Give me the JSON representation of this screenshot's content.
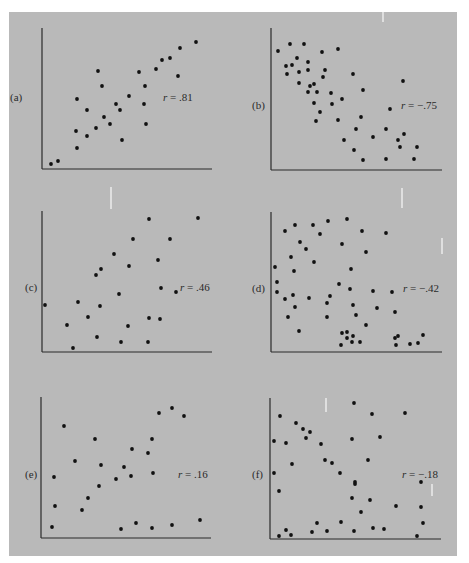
{
  "colors": {
    "background": "#b9b9b9",
    "axis": "#2a2a2a",
    "point": "#111111",
    "text": "#2a2a2a"
  },
  "chart_data": [
    {
      "type": "scatter",
      "panel": "(a)",
      "title": "",
      "r_label": "r = .81",
      "r": 0.81,
      "xlabel": "",
      "ylabel": "",
      "xlim": [
        0,
        100
      ],
      "ylim": [
        0,
        100
      ],
      "grid": false,
      "axes_px": {
        "x0": 42,
        "y0": 169,
        "x1": 212,
        "ytop": 28
      },
      "label_px": {
        "panel": [
          10,
          93
        ],
        "r": [
          163,
          93
        ]
      },
      "points_px": [
        [
          51,
          164
        ],
        [
          58,
          161
        ],
        [
          77,
          99
        ],
        [
          87,
          110
        ],
        [
          76,
          131
        ],
        [
          77,
          148
        ],
        [
          87,
          136
        ],
        [
          96,
          128
        ],
        [
          104,
          117
        ],
        [
          110,
          124
        ],
        [
          116,
          104
        ],
        [
          120,
          110
        ],
        [
          122,
          140
        ],
        [
          98,
          71
        ],
        [
          102,
          86
        ],
        [
          129,
          96
        ],
        [
          139,
          72
        ],
        [
          145,
          86
        ],
        [
          144,
          104
        ],
        [
          146,
          124
        ],
        [
          156,
          69
        ],
        [
          162,
          60
        ],
        [
          170,
          58
        ],
        [
          178,
          76
        ],
        [
          180,
          48
        ],
        [
          196,
          42
        ]
      ]
    },
    {
      "type": "scatter",
      "panel": "(b)",
      "title": "",
      "r_label": "r = −.75",
      "r": -0.75,
      "xlabel": "",
      "ylabel": "",
      "xlim": [
        0,
        100
      ],
      "ylim": [
        0,
        100
      ],
      "grid": false,
      "axes_px": {
        "x0": 271,
        "y0": 170,
        "x1": 442,
        "ytop": 28
      },
      "label_px": {
        "panel": [
          252,
          101
        ],
        "r": [
          401,
          101
        ]
      },
      "points_px": [
        [
          278,
          51
        ],
        [
          290,
          44
        ],
        [
          304,
          44
        ],
        [
          297,
          58
        ],
        [
          286,
          66
        ],
        [
          292,
          65
        ],
        [
          287,
          74
        ],
        [
          299,
          72
        ],
        [
          308,
          62
        ],
        [
          308,
          70
        ],
        [
          322,
          52
        ],
        [
          338,
          49
        ],
        [
          325,
          70
        ],
        [
          323,
          77
        ],
        [
          299,
          83
        ],
        [
          310,
          86
        ],
        [
          314,
          84
        ],
        [
          308,
          92
        ],
        [
          317,
          92
        ],
        [
          314,
          103
        ],
        [
          320,
          112
        ],
        [
          316,
          121
        ],
        [
          331,
          93
        ],
        [
          332,
          104
        ],
        [
          342,
          99
        ],
        [
          338,
          120
        ],
        [
          353,
          74
        ],
        [
          363,
          90
        ],
        [
          361,
          117
        ],
        [
          356,
          129
        ],
        [
          344,
          140
        ],
        [
          354,
          150
        ],
        [
          363,
          160
        ],
        [
          373,
          137
        ],
        [
          386,
          129
        ],
        [
          390,
          109
        ],
        [
          403,
          81
        ],
        [
          404,
          134
        ],
        [
          398,
          140
        ],
        [
          400,
          147
        ],
        [
          417,
          147
        ],
        [
          386,
          159
        ],
        [
          414,
          159
        ]
      ]
    },
    {
      "type": "scatter",
      "panel": "(c)",
      "title": "",
      "r_label": "r = .46",
      "r": 0.46,
      "xlabel": "",
      "ylabel": "",
      "xlim": [
        0,
        100
      ],
      "ylim": [
        0,
        100
      ],
      "grid": false,
      "axes_px": {
        "x0": 42,
        "y0": 352,
        "x1": 212,
        "ytop": 211
      },
      "label_px": {
        "panel": [
          25,
          283
        ],
        "r": [
          180,
          283
        ]
      },
      "points_px": [
        [
          45,
          305
        ],
        [
          67,
          325
        ],
        [
          73,
          348
        ],
        [
          78,
          302
        ],
        [
          88,
          317
        ],
        [
          97,
          337
        ],
        [
          96,
          275
        ],
        [
          101,
          269
        ],
        [
          100,
          306
        ],
        [
          114,
          254
        ],
        [
          119,
          294
        ],
        [
          121,
          342
        ],
        [
          129,
          266
        ],
        [
          128,
          326
        ],
        [
          133,
          239
        ],
        [
          149,
          219
        ],
        [
          149,
          318
        ],
        [
          148,
          342
        ],
        [
          158,
          260
        ],
        [
          161,
          288
        ],
        [
          160,
          319
        ],
        [
          170,
          239
        ],
        [
          176,
          292
        ],
        [
          198,
          218
        ]
      ]
    },
    {
      "type": "scatter",
      "panel": "(d)",
      "title": "",
      "r_label": "r = −.42",
      "r": -0.42,
      "xlabel": "",
      "ylabel": "",
      "xlim": [
        0,
        100
      ],
      "ylim": [
        0,
        100
      ],
      "grid": false,
      "axes_px": {
        "x0": 271,
        "y0": 352,
        "x1": 442,
        "ytop": 212
      },
      "label_px": {
        "panel": [
          252,
          284
        ],
        "r": [
          403,
          284
        ]
      },
      "points_px": [
        [
          285,
          231
        ],
        [
          295,
          225
        ],
        [
          313,
          225
        ],
        [
          328,
          221
        ],
        [
          347,
          219
        ],
        [
          320,
          234
        ],
        [
          300,
          242
        ],
        [
          306,
          249
        ],
        [
          291,
          257
        ],
        [
          314,
          262
        ],
        [
          275,
          267
        ],
        [
          294,
          271
        ],
        [
          277,
          282
        ],
        [
          277,
          292
        ],
        [
          285,
          299
        ],
        [
          293,
          295
        ],
        [
          295,
          307
        ],
        [
          288,
          317
        ],
        [
          299,
          331
        ],
        [
          309,
          298
        ],
        [
          330,
          296
        ],
        [
          327,
          303
        ],
        [
          327,
          317
        ],
        [
          342,
          244
        ],
        [
          362,
          231
        ],
        [
          366,
          252
        ],
        [
          351,
          269
        ],
        [
          339,
          284
        ],
        [
          350,
          289
        ],
        [
          353,
          305
        ],
        [
          356,
          315
        ],
        [
          366,
          325
        ],
        [
          373,
          291
        ],
        [
          377,
          308
        ],
        [
          386,
          233
        ],
        [
          392,
          292
        ],
        [
          395,
          312
        ],
        [
          342,
          333
        ],
        [
          347,
          332
        ],
        [
          347,
          338
        ],
        [
          353,
          336
        ],
        [
          352,
          342
        ],
        [
          360,
          342
        ],
        [
          341,
          345
        ],
        [
          395,
          338
        ],
        [
          398,
          336
        ],
        [
          396,
          345
        ],
        [
          410,
          344
        ],
        [
          418,
          343
        ],
        [
          423,
          335
        ]
      ]
    },
    {
      "type": "scatter",
      "panel": "(e)",
      "title": "",
      "r_label": "r = .16",
      "r": 0.16,
      "xlabel": "",
      "ylabel": "",
      "xlim": [
        0,
        100
      ],
      "ylim": [
        0,
        100
      ],
      "grid": false,
      "axes_px": {
        "x0": 41,
        "y0": 538,
        "x1": 211,
        "ytop": 397
      },
      "label_px": {
        "panel": [
          25,
          470
        ],
        "r": [
          178,
          470
        ]
      },
      "points_px": [
        [
          64,
          426
        ],
        [
          54,
          477
        ],
        [
          55,
          506
        ],
        [
          52,
          527
        ],
        [
          75,
          461
        ],
        [
          82,
          510
        ],
        [
          88,
          498
        ],
        [
          95,
          439
        ],
        [
          101,
          465
        ],
        [
          99,
          486
        ],
        [
          116,
          479
        ],
        [
          124,
          467
        ],
        [
          131,
          476
        ],
        [
          132,
          449
        ],
        [
          121,
          529
        ],
        [
          136,
          523
        ],
        [
          148,
          453
        ],
        [
          152,
          439
        ],
        [
          153,
          473
        ],
        [
          152,
          528
        ],
        [
          159,
          413
        ],
        [
          172,
          408
        ],
        [
          184,
          416
        ],
        [
          172,
          525
        ],
        [
          200,
          520
        ]
      ]
    },
    {
      "type": "scatter",
      "panel": "(f)",
      "title": "",
      "r_label": "r = −.18",
      "r": -0.18,
      "xlabel": "",
      "ylabel": "",
      "xlim": [
        0,
        100
      ],
      "ylim": [
        0,
        100
      ],
      "grid": false,
      "axes_px": {
        "x0": 270,
        "y0": 539,
        "x1": 441,
        "ytop": 398
      },
      "label_px": {
        "panel": [
          252,
          470
        ],
        "r": [
          402,
          470
        ]
      },
      "points_px": [
        [
          280,
          416
        ],
        [
          274,
          441
        ],
        [
          274,
          473
        ],
        [
          279,
          491
        ],
        [
          286,
          443
        ],
        [
          292,
          464
        ],
        [
          296,
          423
        ],
        [
          303,
          429
        ],
        [
          306,
          438
        ],
        [
          310,
          432
        ],
        [
          321,
          444
        ],
        [
          325,
          460
        ],
        [
          332,
          463
        ],
        [
          340,
          473
        ],
        [
          352,
          439
        ],
        [
          354,
          403
        ],
        [
          355,
          482
        ],
        [
          355,
          484
        ],
        [
          352,
          498
        ],
        [
          361,
          512
        ],
        [
          368,
          460
        ],
        [
          370,
          500
        ],
        [
          372,
          414
        ],
        [
          380,
          437
        ],
        [
          396,
          506
        ],
        [
          405,
          413
        ],
        [
          421,
          482
        ],
        [
          421,
          507
        ],
        [
          423,
          523
        ],
        [
          417,
          536
        ],
        [
          279,
          536
        ],
        [
          286,
          530
        ],
        [
          291,
          535
        ],
        [
          312,
          532
        ],
        [
          317,
          523
        ],
        [
          327,
          531
        ],
        [
          341,
          522
        ],
        [
          354,
          531
        ],
        [
          373,
          528
        ],
        [
          384,
          529
        ]
      ]
    }
  ]
}
